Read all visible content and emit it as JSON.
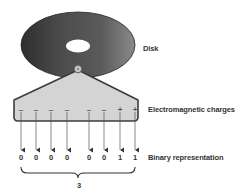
{
  "diagram": {
    "labels": {
      "disk": "Disk",
      "charges": "Electromagnetic charges",
      "binary": "Binary representation"
    },
    "charges": [
      "–",
      "–",
      "–",
      "–",
      "–",
      "–",
      "+",
      "+"
    ],
    "bits": [
      "0",
      "0",
      "0",
      "0",
      "0",
      "0",
      "1",
      "1"
    ],
    "brace_value": "3",
    "colors": {
      "disk": "#3a3a3a",
      "head_fill": "#d4d4d4",
      "head_stroke": "#3c3c3c",
      "text": "#333333"
    }
  }
}
